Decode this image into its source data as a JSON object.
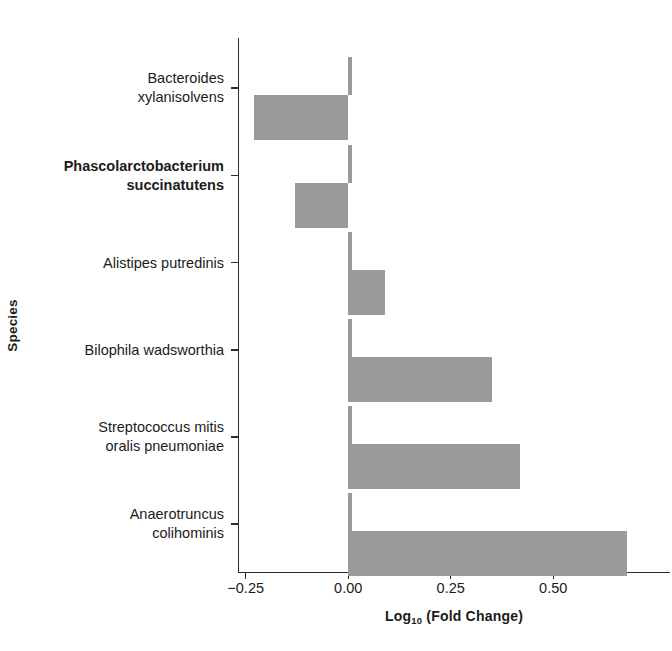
{
  "chart_data": {
    "type": "bar",
    "orientation": "horizontal",
    "title": "",
    "xlabel": "Log10 (Fold Change)",
    "xlabel_base": "Log",
    "xlabel_sub": "10",
    "xlabel_rest": " (Fold Change)",
    "ylabel": "Species",
    "categories": [
      "Bacteroides\nxylanisolvens",
      "Phascolarctobacterium\nsuccinatutens",
      "Alistipes putredinis",
      "Bilophila wadsworthia",
      "Streptococcus mitis\noralis pneumoniae",
      "Anaerotruncus\ncolihominis"
    ],
    "values": [
      -0.23,
      -0.13,
      0.09,
      0.35,
      0.42,
      0.68
    ],
    "xlim": [
      -0.28,
      0.78
    ],
    "xticks": [
      -0.25,
      0.0,
      0.25,
      0.5
    ],
    "xticklabels": [
      "−0.25",
      "0.00",
      "0.25",
      "0.50"
    ],
    "grid": false,
    "legend": "none",
    "bar_color": "#9a9a9a",
    "axis_color": "#2b2b2b",
    "background": "#ffffff"
  },
  "axes": {
    "y_axis_title": "Species",
    "x_axis_title_prefix": "Log",
    "x_axis_title_subscript": "10",
    "x_axis_title_suffix": " (Fold Change)"
  }
}
